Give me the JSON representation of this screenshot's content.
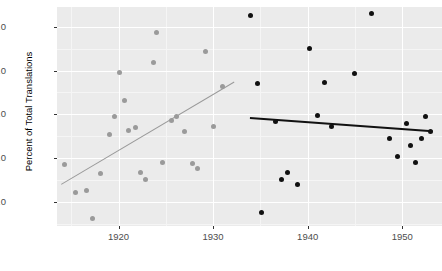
{
  "chart_data": {
    "type": "scatter",
    "title": "",
    "xlabel": "",
    "ylabel": "Percent of Total Translations",
    "xlim": [
      1913.5,
      1954.2
    ],
    "ylim": [
      1.45,
      6.45
    ],
    "grid": true,
    "legend": "none",
    "x_ticks": [
      1920,
      1930,
      1940,
      1950
    ],
    "x_tick_labels": [
      "1920",
      "1930",
      "1940",
      "1950"
    ],
    "x_minor_ticks": [
      1915,
      1925,
      1935,
      1945
    ],
    "y_ticks": [
      2.0,
      3.0,
      4.0,
      5.0,
      6.0
    ],
    "y_tick_labels": [
      "2.0",
      "3.0",
      "4.0",
      "5.0",
      "6.0"
    ],
    "y_minor_ticks": [
      1.5,
      2.5,
      3.5,
      4.5,
      5.5
    ],
    "panel_background": "#ebebeb",
    "gridline_color": "#ffffff",
    "series": [
      {
        "name": "early-period",
        "color": "#9a9a9a",
        "marker": "circle",
        "points": [
          {
            "x": 1914.3,
            "y": 2.86
          },
          {
            "x": 1915.5,
            "y": 2.21
          },
          {
            "x": 1916.6,
            "y": 2.26
          },
          {
            "x": 1917.2,
            "y": 1.63
          },
          {
            "x": 1918.1,
            "y": 2.64
          },
          {
            "x": 1919.0,
            "y": 3.53
          },
          {
            "x": 1919.6,
            "y": 3.96
          },
          {
            "x": 1920.1,
            "y": 4.95
          },
          {
            "x": 1920.6,
            "y": 4.32
          },
          {
            "x": 1921.1,
            "y": 3.63
          },
          {
            "x": 1921.8,
            "y": 3.7
          },
          {
            "x": 1922.3,
            "y": 2.67
          },
          {
            "x": 1922.9,
            "y": 2.51
          },
          {
            "x": 1923.7,
            "y": 5.19
          },
          {
            "x": 1924.0,
            "y": 5.88
          },
          {
            "x": 1924.6,
            "y": 2.89
          },
          {
            "x": 1925.6,
            "y": 3.87
          },
          {
            "x": 1926.1,
            "y": 3.96
          },
          {
            "x": 1927.0,
            "y": 3.61
          },
          {
            "x": 1927.8,
            "y": 2.88
          },
          {
            "x": 1928.4,
            "y": 2.76
          },
          {
            "x": 1929.2,
            "y": 5.44
          },
          {
            "x": 1930.0,
            "y": 3.73
          },
          {
            "x": 1931.0,
            "y": 4.63
          }
        ]
      },
      {
        "name": "late-period",
        "color": "#111111",
        "marker": "circle",
        "points": [
          {
            "x": 1933.9,
            "y": 6.26
          },
          {
            "x": 1934.7,
            "y": 4.7
          },
          {
            "x": 1935.1,
            "y": 1.75
          },
          {
            "x": 1936.6,
            "y": 3.83
          },
          {
            "x": 1937.2,
            "y": 2.52
          },
          {
            "x": 1937.9,
            "y": 2.68
          },
          {
            "x": 1938.9,
            "y": 2.39
          },
          {
            "x": 1940.2,
            "y": 5.5
          },
          {
            "x": 1941.0,
            "y": 3.97
          },
          {
            "x": 1941.8,
            "y": 4.72
          },
          {
            "x": 1942.5,
            "y": 3.73
          },
          {
            "x": 1944.9,
            "y": 4.93
          },
          {
            "x": 1946.7,
            "y": 6.3
          },
          {
            "x": 1948.6,
            "y": 3.45
          },
          {
            "x": 1949.5,
            "y": 3.03
          },
          {
            "x": 1950.4,
            "y": 3.78
          },
          {
            "x": 1950.9,
            "y": 3.29
          },
          {
            "x": 1951.4,
            "y": 2.91
          },
          {
            "x": 1952.0,
            "y": 3.45
          },
          {
            "x": 1952.4,
            "y": 3.94
          },
          {
            "x": 1953.0,
            "y": 3.61
          }
        ]
      }
    ],
    "fits": [
      {
        "name": "early-trend",
        "color": "#9a9a9a",
        "x0": 1913.9,
        "y0": 2.42,
        "x1": 1932.2,
        "y1": 4.76
      },
      {
        "name": "late-trend",
        "color": "#111111",
        "x0": 1933.9,
        "y0": 3.93,
        "x1": 1953.2,
        "y1": 3.63
      }
    ]
  }
}
